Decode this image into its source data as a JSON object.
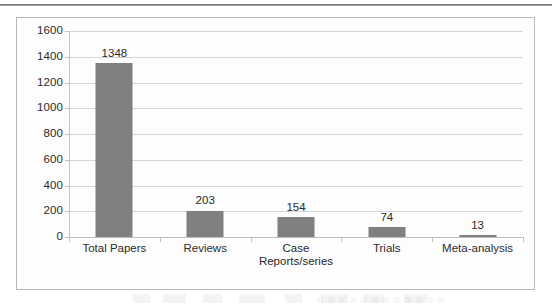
{
  "chart_data": {
    "type": "bar",
    "title": "",
    "subtitle": "",
    "xlabel": "",
    "ylabel": "",
    "categories": [
      "Total Papers",
      "Case\nReports/series",
      "Reviews",
      "Trials",
      "Meta-analysis"
    ],
    "category_labels": [
      "Total Papers",
      "Reviews",
      "Case\nReports/series",
      "Trials",
      "Meta-analysis"
    ],
    "values": [
      1348,
      203,
      154,
      74,
      13
    ],
    "value_labels": [
      "1348",
      "203",
      "154",
      "74",
      "13"
    ],
    "ylim": [
      0,
      1600
    ],
    "ytick_step": 200,
    "yticks": [
      1600,
      1400,
      1200,
      1000,
      800,
      600,
      400,
      200,
      0
    ],
    "ytick_labels": [
      "1600",
      "1400",
      "1200",
      "1000",
      "800",
      "600",
      "400",
      "200",
      "0"
    ],
    "grid": true,
    "grid_axis": "y",
    "legend": false,
    "legend_position": "none",
    "bar_color": "#808080",
    "gridline_color": "#d6d6d6",
    "axis_color": "#c2c2c2",
    "text_color": "#2b2b2b",
    "plot_background": "#fdfdfd",
    "frame_border_color": "#b9b9b9"
  }
}
